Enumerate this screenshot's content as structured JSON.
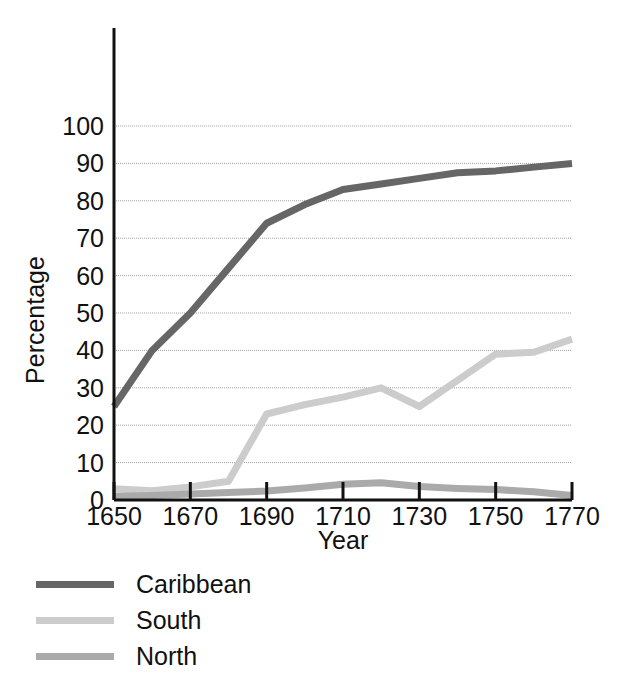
{
  "chart_data": {
    "type": "line",
    "title": "",
    "xlabel": "Year",
    "ylabel": "Percentage",
    "xlim": [
      1650,
      1770
    ],
    "ylim": [
      0,
      100
    ],
    "grid": true,
    "grid_axis": "y",
    "legend_position": "below-left",
    "xticks": [
      1650,
      1670,
      1690,
      1710,
      1730,
      1750,
      1770
    ],
    "xtick_labels": [
      "1650",
      "1670",
      "1690",
      "1710",
      "1730",
      "1750",
      "1770"
    ],
    "yticks": [
      0,
      10,
      20,
      30,
      40,
      50,
      60,
      70,
      80,
      90,
      100
    ],
    "ytick_labels": [
      "0",
      "10",
      "20",
      "30",
      "40",
      "50",
      "60",
      "70",
      "80",
      "90",
      "100"
    ],
    "x": [
      1650,
      1660,
      1670,
      1680,
      1690,
      1700,
      1710,
      1720,
      1730,
      1740,
      1750,
      1760,
      1770
    ],
    "series": [
      {
        "name": "Caribbean",
        "color": "#666666",
        "values": [
          25,
          40,
          50,
          62,
          74,
          79,
          83,
          84.5,
          86,
          87.5,
          88,
          89,
          90
        ]
      },
      {
        "name": "South",
        "color": "#cccccc",
        "values": [
          3,
          2.5,
          3.5,
          5,
          23,
          25.5,
          27.5,
          30,
          25,
          32,
          39,
          39.5,
          43
        ]
      },
      {
        "name": "North",
        "color": "#aaaaaa",
        "values": [
          1,
          1.2,
          1.6,
          2,
          2.4,
          3.2,
          4.2,
          4.6,
          3.6,
          3.1,
          2.8,
          2.2,
          1.2
        ]
      }
    ]
  },
  "legend": {
    "items": [
      {
        "label": "Caribbean",
        "color": "#666666"
      },
      {
        "label": "South",
        "color": "#cccccc"
      },
      {
        "label": "North",
        "color": "#aaaaaa"
      }
    ]
  }
}
